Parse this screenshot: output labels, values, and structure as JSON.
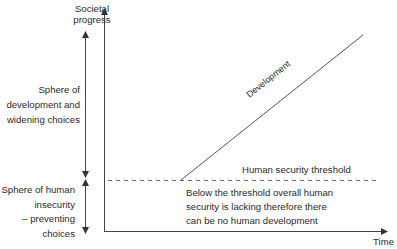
{
  "diagram": {
    "y_axis_label_line1": "Societal",
    "y_axis_label_line2": "progress",
    "x_axis_label": "Time",
    "upper_sphere": {
      "line1": "Sphere of",
      "line2": "development and",
      "line3": "widening choices"
    },
    "lower_sphere": {
      "line1": "Sphere of human",
      "line2": "insecurity",
      "line3": "– preventing",
      "line4": "choices"
    },
    "development_line_label": "Development",
    "threshold_label": "Human security threshold",
    "below_threshold_note": {
      "line1": "Below the threshold overall human",
      "line2": "security is lacking therefore there",
      "line3": "can be no human development"
    },
    "colors": {
      "line": "#444444",
      "dashed": "#666666",
      "text": "#2a2a2a"
    }
  }
}
